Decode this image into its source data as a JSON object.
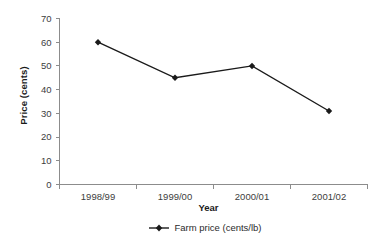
{
  "chart_data": {
    "type": "line",
    "title": "",
    "xlabel": "Year",
    "ylabel": "Price (cents)",
    "categories": [
      "1998/99",
      "1999/00",
      "2000/01",
      "2001/02"
    ],
    "series": [
      {
        "name": "Farm price (cents/lb)",
        "values": [
          60,
          45,
          50,
          31
        ],
        "color": "#1a1a1a",
        "marker": "diamond"
      }
    ],
    "ylim": [
      0,
      70
    ],
    "ytick_step": 10,
    "yticks": [
      "0",
      "10",
      "20",
      "30",
      "40",
      "50",
      "60",
      "70"
    ],
    "grid": false,
    "legend_position": "bottom",
    "legend_entries": [
      "Farm price (cents/lb)"
    ]
  },
  "axes": {
    "y_title": "Price (cents)",
    "x_title": "Year"
  },
  "legend": {
    "entry_label": "Farm price (cents/lb)",
    "marker_icon": "diamond-marker-icon"
  },
  "colors": {
    "series": "#1a1a1a",
    "axis": "#808080",
    "tick_label": "#3d3d3d",
    "background": "#ffffff"
  }
}
